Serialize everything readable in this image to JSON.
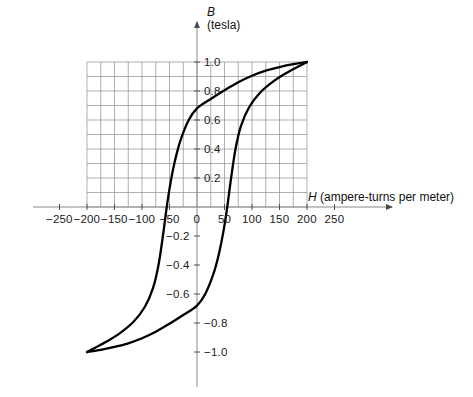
{
  "figure": {
    "type": "hysteresis-loop-diagram",
    "background": "#ffffff",
    "curve_color": "#000000",
    "grid_color": "#888888",
    "axis_color": "#808080",
    "text_color": "#1a1a1a"
  },
  "axes": {
    "y": {
      "symbol": "B",
      "unit": "(tesla)",
      "arrow": true
    },
    "x": {
      "symbol": "H",
      "unit": "(ampere-turns per meter)",
      "arrow": true
    }
  },
  "chart_data": {
    "type": "line",
    "title": "",
    "xlabel": "H (ampere-turns per meter)",
    "ylabel": "B (tesla)",
    "xlim": [
      -275,
      275
    ],
    "ylim": [
      -1.12,
      1.12
    ],
    "grid": true,
    "grid_x_range": [
      -200,
      200
    ],
    "grid_y_range": [
      0,
      1.0
    ],
    "grid_x_step": 25,
    "grid_y_step": 0.1,
    "legend": "none",
    "xticks": [
      -250,
      -200,
      -150,
      -100,
      -50,
      0,
      50,
      100,
      150,
      200,
      250
    ],
    "xtick_labels": [
      "−250",
      "−200",
      "−150",
      "−100",
      "−50",
      "0",
      "50",
      "100",
      "150",
      "200",
      "250"
    ],
    "yticks": [
      1.0,
      0.8,
      0.6,
      0.4,
      0.2,
      -0.2,
      -0.4,
      -0.6,
      -0.8,
      -1.0
    ],
    "ytick_labels": [
      "1.0",
      "0.8",
      "0.6",
      "0.4",
      "0.2",
      "−0.2",
      "−0.4",
      "−0.6",
      "−0.8",
      "−1.0"
    ],
    "ytick_label_side": {
      "1.0": "right",
      "0.8": "right",
      "0.6": "right",
      "0.4": "right",
      "0.2": "right",
      "-0.2": "left",
      "-0.4": "left",
      "-0.6": "left",
      "-0.8": "right",
      "-1.0": "right"
    },
    "saturation": {
      "H": 200,
      "B": 1.0
    },
    "remanence": {
      "upper_B": 0.68,
      "lower_B": -0.68
    },
    "coercivity": {
      "left_H": -55,
      "right_H": 65
    },
    "series": [
      {
        "name": "upper-branch-descending",
        "comment": "Traced from saturation (+200,+1.0) leftwards/downwards to (-200,-1.0)",
        "points": [
          [
            200,
            1.0
          ],
          [
            175,
            0.985
          ],
          [
            150,
            0.965
          ],
          [
            125,
            0.94
          ],
          [
            100,
            0.905
          ],
          [
            75,
            0.86
          ],
          [
            50,
            0.805
          ],
          [
            25,
            0.745
          ],
          [
            0,
            0.68
          ],
          [
            -15,
            0.6
          ],
          [
            -30,
            0.46
          ],
          [
            -40,
            0.32
          ],
          [
            -48,
            0.17
          ],
          [
            -55,
            0.0
          ],
          [
            -62,
            -0.2
          ],
          [
            -70,
            -0.4
          ],
          [
            -80,
            -0.56
          ],
          [
            -95,
            -0.69
          ],
          [
            -115,
            -0.79
          ],
          [
            -140,
            -0.87
          ],
          [
            -165,
            -0.93
          ],
          [
            -185,
            -0.97
          ],
          [
            -200,
            -1.0
          ]
        ]
      },
      {
        "name": "lower-branch-ascending",
        "comment": "Traced from (-200,-1.0) rightwards/upwards back to (+200,+1.0)",
        "points": [
          [
            -200,
            -1.0
          ],
          [
            -175,
            -0.985
          ],
          [
            -150,
            -0.965
          ],
          [
            -125,
            -0.94
          ],
          [
            -100,
            -0.905
          ],
          [
            -75,
            -0.86
          ],
          [
            -50,
            -0.805
          ],
          [
            -25,
            -0.745
          ],
          [
            0,
            -0.68
          ],
          [
            15,
            -0.6
          ],
          [
            30,
            -0.46
          ],
          [
            40,
            -0.32
          ],
          [
            48,
            -0.17
          ],
          [
            55,
            0.0
          ],
          [
            62,
            0.2
          ],
          [
            70,
            0.4
          ],
          [
            80,
            0.56
          ],
          [
            95,
            0.69
          ],
          [
            115,
            0.79
          ],
          [
            140,
            0.87
          ],
          [
            165,
            0.93
          ],
          [
            185,
            0.97
          ],
          [
            200,
            1.0
          ]
        ]
      }
    ]
  }
}
